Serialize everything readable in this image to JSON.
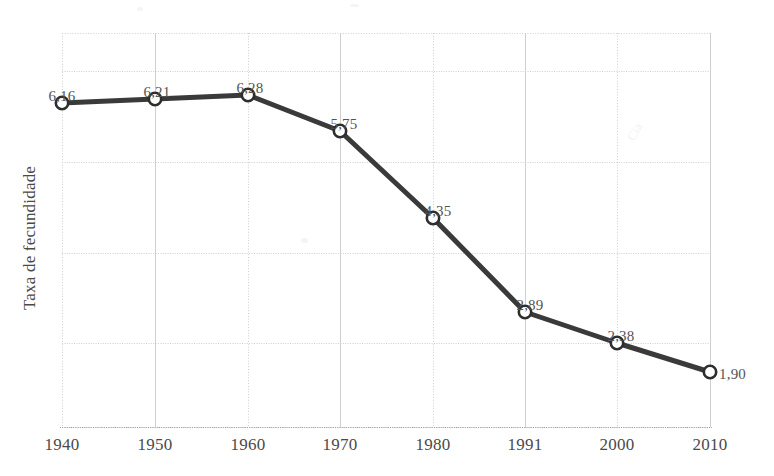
{
  "chart_data": {
    "type": "line",
    "title": "",
    "xlabel": "",
    "ylabel": "Taxa de fecundidade",
    "categories": [
      "1940",
      "1950",
      "1960",
      "1970",
      "1980",
      "1991",
      "2000",
      "2010"
    ],
    "values": [
      6.16,
      6.21,
      6.28,
      5.75,
      4.35,
      2.89,
      2.38,
      1.9
    ],
    "point_labels": [
      "6,16",
      "6,21",
      "6,28",
      "5,75",
      "4,35",
      "2,89",
      "2,38",
      "1,90"
    ],
    "xticklabels": [
      "1940",
      "1950",
      "1960",
      "1970",
      "1980",
      "1991",
      "2000",
      "2010"
    ],
    "yticklabels": [],
    "ylim": [
      1.0,
      7.0
    ],
    "grid": true,
    "legend": null,
    "legend_position": "none",
    "series": [
      {
        "name": "Taxa de fecundidade",
        "values": [
          6.16,
          6.21,
          6.28,
          5.75,
          4.35,
          2.89,
          2.38,
          1.9
        ]
      }
    ],
    "colors": {
      "line": "#3a3a3a",
      "marker_fill": "#ffffff",
      "marker_stroke": "#2e2e2e",
      "grid": "#cfcfcf",
      "axis": "#9a9a9a",
      "text": "#4a4a4a",
      "background": "#ffffff"
    },
    "geometry": {
      "plot_left": 62,
      "plot_right": 710,
      "plot_top": 33,
      "plot_bottom": 427,
      "x_positions": [
        62,
        155,
        248,
        340,
        433,
        525,
        617,
        710
      ],
      "y_positions": [
        103,
        99,
        95,
        131,
        218,
        312,
        343,
        372
      ],
      "hgrid_y": [
        33,
        71,
        162,
        253,
        343,
        427
      ],
      "label_offsets": [
        {
          "x": 62,
          "y": 88,
          "align": "center"
        },
        {
          "x": 157,
          "y": 84,
          "align": "center"
        },
        {
          "x": 250,
          "y": 80,
          "align": "center"
        },
        {
          "x": 344,
          "y": 116,
          "align": "center"
        },
        {
          "x": 438,
          "y": 203,
          "align": "center"
        },
        {
          "x": 530,
          "y": 297,
          "align": "center"
        },
        {
          "x": 621,
          "y": 328,
          "align": "center"
        },
        {
          "x": 719,
          "y": 366,
          "align": "right"
        }
      ]
    },
    "watermark_text": "Cia"
  }
}
